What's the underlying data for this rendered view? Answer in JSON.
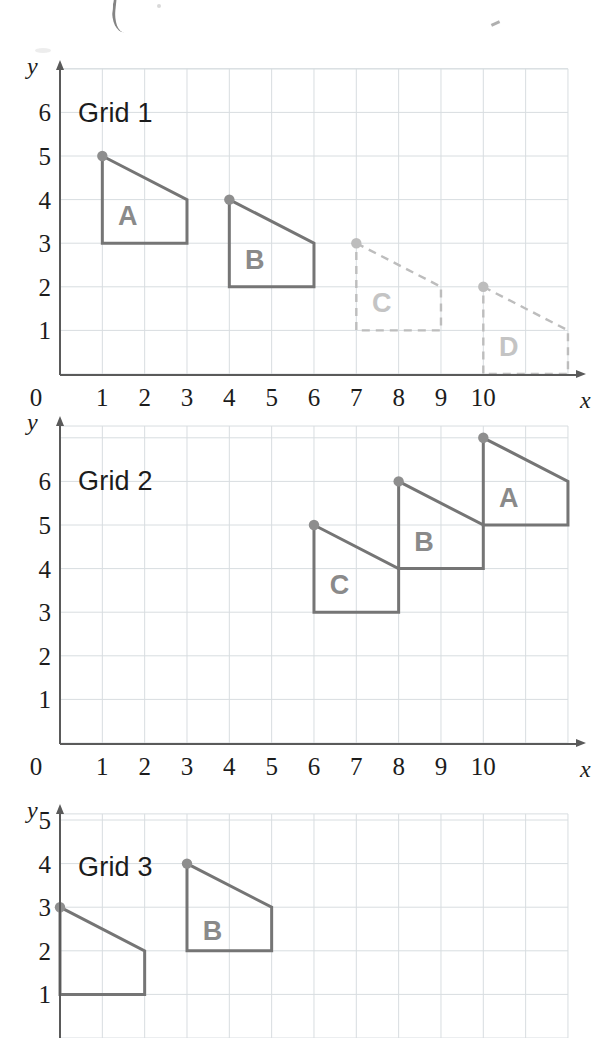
{
  "colors": {
    "grid_line": "#d8dde0",
    "axis": "#5a5a5a",
    "solid_shape": "#757575",
    "dashed_shape": "#bdbdbd",
    "vertex_dot_solid": "#8e8e8e",
    "vertex_dot_dashed": "#bdbdbd",
    "label_solid": "#8a8a8a",
    "label_dashed": "#c4c4c4",
    "tick_text": "#1c1c1c"
  },
  "axis": {
    "x_name": "x",
    "y_name": "y",
    "origin_label": "0",
    "x_ticks": [
      "1",
      "2",
      "3",
      "4",
      "5",
      "6",
      "7",
      "8",
      "9",
      "10"
    ],
    "y_ticks": [
      "1",
      "2",
      "3",
      "4",
      "5",
      "6"
    ],
    "x_range": [
      0,
      12
    ],
    "y_range": [
      0,
      7
    ]
  },
  "grids": [
    {
      "title": "Grid 1",
      "shapes": [
        {
          "label": "A",
          "style": "solid",
          "label_at": [
            1.6,
            3.62
          ],
          "vertices": [
            [
              1,
              5
            ],
            [
              3,
              4
            ],
            [
              3,
              3
            ],
            [
              1,
              3
            ]
          ],
          "marked_vertex": [
            1,
            5
          ]
        },
        {
          "label": "B",
          "style": "solid",
          "label_at": [
            4.6,
            2.62
          ],
          "vertices": [
            [
              4,
              4
            ],
            [
              6,
              3
            ],
            [
              6,
              2
            ],
            [
              4,
              2
            ]
          ],
          "marked_vertex": [
            4,
            4
          ]
        },
        {
          "label": "C",
          "style": "dashed",
          "label_at": [
            7.6,
            1.62
          ],
          "vertices": [
            [
              7,
              3
            ],
            [
              9,
              2
            ],
            [
              9,
              1
            ],
            [
              7,
              1
            ]
          ],
          "marked_vertex": [
            7,
            3
          ]
        },
        {
          "label": "D",
          "style": "dashed",
          "label_at": [
            10.6,
            0.62
          ],
          "vertices": [
            [
              10,
              2
            ],
            [
              12,
              1
            ],
            [
              12,
              0
            ],
            [
              10,
              0
            ]
          ],
          "marked_vertex": [
            10,
            2
          ]
        }
      ]
    },
    {
      "title": "Grid 2",
      "shapes": [
        {
          "label": "C",
          "style": "solid",
          "label_at": [
            6.6,
            3.62
          ],
          "vertices": [
            [
              6,
              5
            ],
            [
              8,
              4
            ],
            [
              8,
              3
            ],
            [
              6,
              3
            ]
          ],
          "marked_vertex": [
            6,
            5
          ]
        },
        {
          "label": "B",
          "style": "solid",
          "label_at": [
            8.6,
            4.62
          ],
          "vertices": [
            [
              8,
              6
            ],
            [
              10,
              5
            ],
            [
              10,
              4
            ],
            [
              8,
              4
            ]
          ],
          "marked_vertex": [
            8,
            6
          ]
        },
        {
          "label": "A",
          "style": "solid",
          "label_at": [
            10.6,
            5.62
          ],
          "vertices": [
            [
              10,
              7
            ],
            [
              12,
              6
            ],
            [
              12,
              5
            ],
            [
              10,
              5
            ]
          ],
          "marked_vertex": [
            10,
            7
          ]
        }
      ]
    },
    {
      "title": "Grid 3",
      "shapes": [
        {
          "label": "",
          "style": "solid",
          "label_at": null,
          "vertices": [
            [
              0,
              3
            ],
            [
              2,
              2
            ],
            [
              2,
              1
            ],
            [
              0,
              1
            ]
          ],
          "marked_vertex": [
            0,
            3
          ]
        },
        {
          "label": "B",
          "style": "solid",
          "label_at": [
            3.6,
            2.45
          ],
          "vertices": [
            [
              3,
              4
            ],
            [
              5,
              3
            ],
            [
              5,
              2
            ],
            [
              3,
              2
            ]
          ],
          "marked_vertex": [
            3,
            4
          ]
        }
      ]
    }
  ]
}
